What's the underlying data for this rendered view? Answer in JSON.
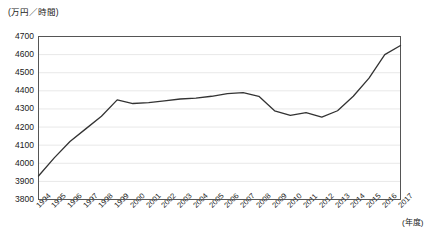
{
  "chart_data": {
    "type": "line",
    "title": "",
    "subtitle": "",
    "xlabel": "(年度)",
    "ylabel": "(万円／時間)",
    "ylim": [
      3800,
      4700
    ],
    "ytick_step": 100,
    "yticks": [
      4700,
      4600,
      4500,
      4400,
      4300,
      4200,
      4100,
      4000,
      3900,
      3800
    ],
    "grid": true,
    "grid_axis": "y",
    "legend": false,
    "legend_position": "none",
    "line_color": "#333333",
    "categories": [
      "1994",
      "1995",
      "1996",
      "1997",
      "1998",
      "1999",
      "2000",
      "2001",
      "2002",
      "2003",
      "2004",
      "2005",
      "2006",
      "2007",
      "2008",
      "2009",
      "2010",
      "2011",
      "2012",
      "2013",
      "2014",
      "2015",
      "2016",
      "2017"
    ],
    "values": [
      3930,
      4030,
      4120,
      4190,
      4260,
      4350,
      4330,
      4335,
      4345,
      4355,
      4360,
      4370,
      4385,
      4390,
      4370,
      4290,
      4265,
      4280,
      4255,
      4290,
      4370,
      4470,
      4600,
      4650
    ]
  }
}
